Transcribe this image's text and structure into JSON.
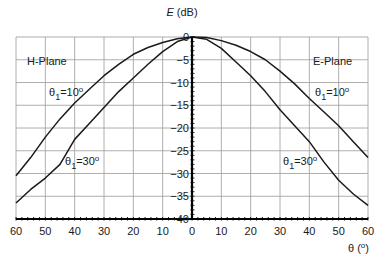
{
  "chart_data": {
    "type": "line",
    "title": "",
    "ylabel": "E (dB)",
    "xlabel": "θ (°)",
    "ylim": [
      -40,
      0
    ],
    "xlim": [
      -60,
      60
    ],
    "grid": true,
    "x_tick_labels": [
      "60",
      "50",
      "40",
      "30",
      "20",
      "10",
      "0",
      "10",
      "20",
      "30",
      "40",
      "50",
      "60"
    ],
    "y_tick_labels": [
      "0",
      "-5",
      "-10",
      "-15",
      "-20",
      "-25",
      "-30",
      "-35",
      "-40"
    ],
    "annotations": {
      "left_plane": "H-Plane",
      "right_plane": "E-Plane",
      "theta_symbol": "θ",
      "sub": "1",
      "eq10": "=10",
      "eq30": "=30",
      "deg": "o"
    },
    "x": [
      0,
      5,
      10,
      15,
      20,
      25,
      30,
      35,
      40,
      45,
      50,
      55,
      60
    ],
    "series": [
      {
        "name": "H-Plane θ1=10°",
        "side": "left",
        "values": [
          0,
          -0.4,
          -1.2,
          -2.3,
          -3.8,
          -6,
          -8.5,
          -11.5,
          -14.5,
          -18,
          -22,
          -26.5,
          -30.5
        ]
      },
      {
        "name": "H-Plane θ1=30°",
        "side": "left",
        "values": [
          0,
          -1,
          -3.2,
          -6,
          -9,
          -12,
          -15.5,
          -19,
          -22.5,
          -28,
          -31,
          -33.5,
          -36.5
        ]
      },
      {
        "name": "E-Plane θ1=10°",
        "side": "right",
        "values": [
          0,
          -0.1,
          -0.8,
          -1.8,
          -3.2,
          -5,
          -7.5,
          -10.3,
          -13.5,
          -16.5,
          -19.5,
          -23,
          -26.5
        ]
      },
      {
        "name": "E-Plane θ1=30°",
        "side": "right",
        "values": [
          0,
          -0.5,
          -2.5,
          -5.5,
          -8.5,
          -12,
          -16,
          -19.5,
          -23,
          -27.5,
          -31.5,
          -34.5,
          -37
        ]
      }
    ]
  }
}
